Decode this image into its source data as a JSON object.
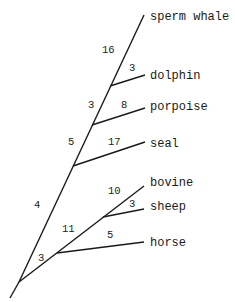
{
  "diagram": {
    "type": "phylogenetic-tree",
    "taxa": [
      {
        "id": "sperm_whale",
        "label": "sperm whale"
      },
      {
        "id": "dolphin",
        "label": "dolphin"
      },
      {
        "id": "porpoise",
        "label": "porpoise"
      },
      {
        "id": "seal",
        "label": "seal"
      },
      {
        "id": "bovine",
        "label": "bovine"
      },
      {
        "id": "sheep",
        "label": "sheep"
      },
      {
        "id": "horse",
        "label": "horse"
      }
    ],
    "branch_lengths": {
      "sperm_whale": "16",
      "dolphin": "3",
      "dolphin_sperm_stem": "3",
      "porpoise": "8",
      "cetacean_stem": "5",
      "seal": "17",
      "marine_stem": "4",
      "bovine": "10",
      "sheep": "3",
      "ruminant_stem": "11",
      "horse": "5",
      "ungulate_stem": "3"
    }
  }
}
